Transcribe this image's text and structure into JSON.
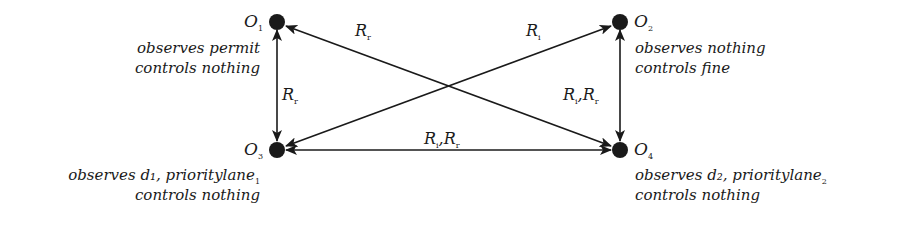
{
  "diagram": {
    "type": "directed-graph",
    "nodes": [
      {
        "id": "O1",
        "name": "O",
        "sub": "1",
        "observes": "observes permit",
        "controls": "controls nothing"
      },
      {
        "id": "O2",
        "name": "O",
        "sub": "2",
        "observes": "observes nothing",
        "controls": "controls fine"
      },
      {
        "id": "O3",
        "name": "O",
        "sub": "3",
        "observes": "observes d1, prioritylane",
        "observes_sub": "1",
        "controls": "controls nothing"
      },
      {
        "id": "O4",
        "name": "O",
        "sub": "4",
        "observes": "observes d2, prioritylane",
        "observes_sub": "2",
        "controls": "controls nothing"
      }
    ],
    "edges": [
      {
        "from": "O1",
        "to": "O3",
        "bidirectional": true,
        "label": [
          {
            "r": "R",
            "s": "r"
          }
        ]
      },
      {
        "from": "O2",
        "to": "O4",
        "bidirectional": true,
        "label": [
          {
            "r": "R",
            "s": "i"
          },
          {
            "r": "R",
            "s": "r"
          }
        ]
      },
      {
        "from": "O3",
        "to": "O4",
        "bidirectional": true,
        "label": [
          {
            "r": "R",
            "s": "i"
          },
          {
            "r": "R",
            "s": "r"
          }
        ]
      },
      {
        "from": "O4",
        "to": "O1",
        "bidirectional": true,
        "label": [
          {
            "r": "R",
            "s": "r"
          }
        ]
      },
      {
        "from": "O3",
        "to": "O2",
        "bidirectional": true,
        "label": [
          {
            "r": "R",
            "s": "i"
          }
        ]
      }
    ]
  },
  "labels": {
    "o1": {
      "name": "O",
      "sub": "1",
      "line1": "observes permit",
      "line2": "controls nothing"
    },
    "o2": {
      "name": "O",
      "sub": "2",
      "line1": "observes nothing",
      "line2": "controls fine"
    },
    "o3": {
      "name": "O",
      "sub": "3",
      "line1": "observes d₁, prioritylane",
      "line1_sub": "1",
      "line2": "controls nothing"
    },
    "o4": {
      "name": "O",
      "sub": "4",
      "line1": "observes d₂, prioritylane",
      "line1_sub": "2",
      "line2": "controls nothing"
    },
    "e_o1_o3": {
      "r": "R",
      "s": "r"
    },
    "e_o2_o4": {
      "r1": "R",
      "s1": "i",
      "sep": ",",
      "r2": "R",
      "s2": "r"
    },
    "e_o3_o4": {
      "r1": "R",
      "s1": "i",
      "sep": ",",
      "r2": "R",
      "s2": "r"
    },
    "e_o4_o1": {
      "r": "R",
      "s": "r"
    },
    "e_o3_o2": {
      "r": "R",
      "s": "i"
    }
  },
  "colors": {
    "ink": "#1a1a1a",
    "background": "#ffffff"
  }
}
